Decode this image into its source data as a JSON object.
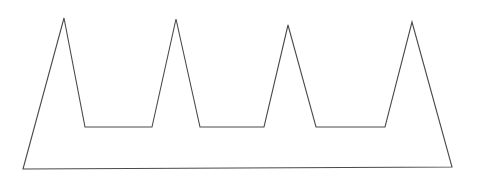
{
  "figure": {
    "name": "crown-outline",
    "canvas": {
      "width": 483,
      "height": 180,
      "background_color": "#ffffff"
    },
    "style": {
      "stroke_color": "#4a4a4a",
      "stroke_width": 1.1,
      "fill": "none"
    },
    "geometry": {
      "closed": true,
      "vertex_count": 14,
      "points": [
        [
          23,
          169
        ],
        [
          64,
          18
        ],
        [
          85,
          127
        ],
        [
          152,
          127
        ],
        [
          176,
          19
        ],
        [
          200,
          127
        ],
        [
          264,
          127
        ],
        [
          288,
          25
        ],
        [
          316,
          127
        ],
        [
          385,
          127
        ],
        [
          412,
          22
        ],
        [
          452,
          167
        ],
        [
          23,
          169
        ]
      ],
      "points_string": "23,169 64,18 85,127 152,127 176,19 200,127 264,127 288,25 316,127 385,127 412,22 452,167"
    },
    "peaks": [
      {
        "index": 1,
        "apex_x": 64,
        "apex_y": 18,
        "height_px": 151
      },
      {
        "index": 2,
        "apex_x": 176,
        "apex_y": 19,
        "height_px": 150
      },
      {
        "index": 3,
        "apex_x": 288,
        "apex_y": 25,
        "height_px": 144
      },
      {
        "index": 4,
        "apex_x": 412,
        "apex_y": 22,
        "height_px": 147
      }
    ],
    "valleys": [
      {
        "index": 1,
        "left_x": 85,
        "right_x": 152,
        "floor_y": 127,
        "width_px": 67
      },
      {
        "index": 2,
        "left_x": 200,
        "right_x": 264,
        "floor_y": 127,
        "width_px": 64
      },
      {
        "index": 3,
        "left_x": 316,
        "right_x": 385,
        "floor_y": 127,
        "width_px": 69
      }
    ],
    "baseline": {
      "left_x": 23,
      "left_y": 169,
      "right_x": 452,
      "right_y": 167,
      "width_px": 429
    }
  }
}
